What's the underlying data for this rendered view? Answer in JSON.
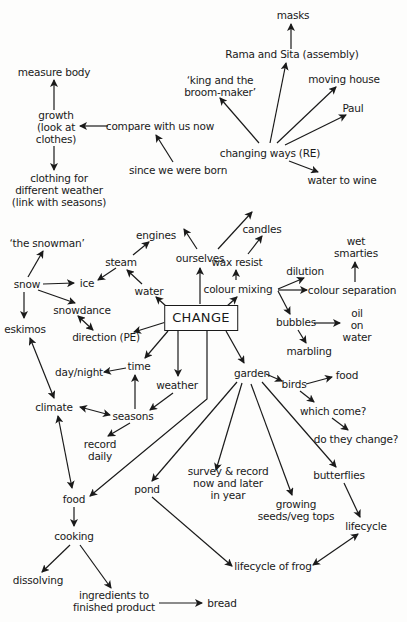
{
  "diagram": {
    "type": "concept-map",
    "root": "change",
    "colors": {
      "ink": "#1a1a1a",
      "background": "#fdfdfc"
    },
    "nodes": [
      {
        "id": "change",
        "label": "CHANGE",
        "x": 201,
        "y": 318,
        "root": true
      },
      {
        "id": "ourselves",
        "label": "ourselves",
        "x": 200,
        "y": 258
      },
      {
        "id": "since_born",
        "label": "since we were born",
        "x": 178,
        "y": 170
      },
      {
        "id": "compare",
        "label": "compare with us now",
        "x": 160,
        "y": 126
      },
      {
        "id": "growth",
        "label": "growth\n(look at\nclothes)",
        "x": 56,
        "y": 127
      },
      {
        "id": "measure",
        "label": "measure body",
        "x": 54,
        "y": 72
      },
      {
        "id": "clothing",
        "label": "clothing for\ndifferent weather\n(link with seasons)",
        "x": 59,
        "y": 190
      },
      {
        "id": "changing_ways",
        "label": "changing ways (RE)",
        "x": 270,
        "y": 153
      },
      {
        "id": "rama",
        "label": "Rama and Sita (assembly)",
        "x": 292,
        "y": 54
      },
      {
        "id": "masks",
        "label": "masks",
        "x": 293,
        "y": 15
      },
      {
        "id": "king",
        "label": "‘king and the\nbroom-maker’",
        "x": 220,
        "y": 86
      },
      {
        "id": "moving",
        "label": "moving house",
        "x": 344,
        "y": 79
      },
      {
        "id": "paul",
        "label": "Paul",
        "x": 353,
        "y": 108
      },
      {
        "id": "wine",
        "label": "water to wine",
        "x": 342,
        "y": 180
      },
      {
        "id": "wax",
        "label": "wax resist",
        "x": 237,
        "y": 262
      },
      {
        "id": "candles",
        "label": "candles",
        "x": 262,
        "y": 229
      },
      {
        "id": "colour_mixing",
        "label": "colour mixing",
        "x": 238,
        "y": 289
      },
      {
        "id": "dilution",
        "label": "dilution",
        "x": 305,
        "y": 271
      },
      {
        "id": "colour_sep",
        "label": "colour separation",
        "x": 352,
        "y": 290
      },
      {
        "id": "smarties",
        "label": "wet\nsmarties",
        "x": 356,
        "y": 247
      },
      {
        "id": "bubbles",
        "label": "bubbles",
        "x": 296,
        "y": 322
      },
      {
        "id": "oil",
        "label": "oil\non\nwater",
        "x": 357,
        "y": 325
      },
      {
        "id": "marbling",
        "label": "marbling",
        "x": 309,
        "y": 351
      },
      {
        "id": "water",
        "label": "water",
        "x": 149,
        "y": 291
      },
      {
        "id": "steam",
        "label": "steam",
        "x": 121,
        "y": 262
      },
      {
        "id": "engines",
        "label": "engines",
        "x": 156,
        "y": 235
      },
      {
        "id": "ice",
        "label": "ice",
        "x": 87,
        "y": 283
      },
      {
        "id": "snow",
        "label": "snow",
        "x": 27,
        "y": 284
      },
      {
        "id": "snowman",
        "label": "‘the snowman’",
        "x": 47,
        "y": 243
      },
      {
        "id": "snowdance",
        "label": "snowdance",
        "x": 82,
        "y": 310
      },
      {
        "id": "direction",
        "label": "direction (PE)",
        "x": 106,
        "y": 337
      },
      {
        "id": "eskimos",
        "label": "eskimos",
        "x": 25,
        "y": 329
      },
      {
        "id": "time",
        "label": "time",
        "x": 139,
        "y": 366
      },
      {
        "id": "day_night",
        "label": "day/night",
        "x": 79,
        "y": 372
      },
      {
        "id": "weather",
        "label": "weather",
        "x": 177,
        "y": 385
      },
      {
        "id": "seasons",
        "label": "seasons",
        "x": 133,
        "y": 416
      },
      {
        "id": "climate",
        "label": "climate",
        "x": 54,
        "y": 407
      },
      {
        "id": "record_daily",
        "label": "record\ndaily",
        "x": 100,
        "y": 450
      },
      {
        "id": "garden",
        "label": "garden",
        "x": 252,
        "y": 373
      },
      {
        "id": "birds",
        "label": "birds",
        "x": 294,
        "y": 384
      },
      {
        "id": "food_birds",
        "label": "food",
        "x": 347,
        "y": 375
      },
      {
        "id": "which_come",
        "label": "which come?",
        "x": 333,
        "y": 411
      },
      {
        "id": "change_q",
        "label": "do they change?",
        "x": 356,
        "y": 439
      },
      {
        "id": "butterflies",
        "label": "butterflies",
        "x": 339,
        "y": 475
      },
      {
        "id": "lifecycle",
        "label": "lifecycle",
        "x": 366,
        "y": 526
      },
      {
        "id": "survey",
        "label": "survey & record\nnow and later\nin year",
        "x": 228,
        "y": 483
      },
      {
        "id": "pond",
        "label": "pond",
        "x": 147,
        "y": 489
      },
      {
        "id": "growing",
        "label": "growing\nseeds/veg tops",
        "x": 296,
        "y": 510
      },
      {
        "id": "frog",
        "label": "lifecycle of frog",
        "x": 273,
        "y": 566
      },
      {
        "id": "food",
        "label": "food",
        "x": 74,
        "y": 499
      },
      {
        "id": "cooking",
        "label": "cooking",
        "x": 74,
        "y": 536
      },
      {
        "id": "dissolving",
        "label": "dissolving",
        "x": 38,
        "y": 580
      },
      {
        "id": "ingredients",
        "label": "ingredients to\nfinished product",
        "x": 114,
        "y": 601
      },
      {
        "id": "bread",
        "label": "bread",
        "x": 222,
        "y": 603
      }
    ],
    "edges": [
      {
        "from": "change",
        "to": "ourselves",
        "pts": [
          [
            200,
            304
          ],
          [
            200,
            268
          ]
        ]
      },
      {
        "from": "ourselves",
        "to": "since_born",
        "pts": [
          [
            197,
            249
          ],
          [
            184,
            229
          ]
        ]
      },
      {
        "from": "ourselves",
        "to": "changing_ways",
        "pts": [
          [
            218,
            249
          ],
          [
            252,
            212
          ]
        ]
      },
      {
        "from": "since_born",
        "to": "compare",
        "pts": [
          [
            173,
            162
          ],
          [
            156,
            135
          ]
        ]
      },
      {
        "from": "compare",
        "to": "growth",
        "pts": [
          [
            108,
            126
          ],
          [
            80,
            126
          ]
        ]
      },
      {
        "from": "growth",
        "to": "measure",
        "pts": [
          [
            54,
            110
          ],
          [
            54,
            80
          ]
        ]
      },
      {
        "from": "growth",
        "to": "clothing",
        "pts": [
          [
            54,
            146
          ],
          [
            54,
            170
          ]
        ]
      },
      {
        "from": "changing_ways",
        "to": "rama",
        "pts": [
          [
            270,
            143
          ],
          [
            286,
            63
          ]
        ]
      },
      {
        "from": "rama",
        "to": "masks",
        "pts": [
          [
            291,
            49
          ],
          [
            291,
            24
          ]
        ]
      },
      {
        "from": "changing_ways",
        "to": "king",
        "pts": [
          [
            259,
            143
          ],
          [
            220,
            98
          ]
        ]
      },
      {
        "from": "changing_ways",
        "to": "moving",
        "pts": [
          [
            277,
            143
          ],
          [
            336,
            87
          ]
        ]
      },
      {
        "from": "changing_ways",
        "to": "paul",
        "pts": [
          [
            285,
            145
          ],
          [
            346,
            115
          ]
        ]
      },
      {
        "from": "changing_ways",
        "to": "wine",
        "pts": [
          [
            289,
            161
          ],
          [
            318,
            172
          ]
        ]
      },
      {
        "from": "change",
        "to": "colour_mixing",
        "pts": [
          [
            226,
            307
          ],
          [
            237,
            297
          ]
        ]
      },
      {
        "from": "colour_mixing",
        "to": "wax",
        "pts": [
          [
            236,
            280
          ],
          [
            236,
            270
          ]
        ]
      },
      {
        "from": "wax",
        "to": "candles",
        "pts": [
          [
            248,
            254
          ],
          [
            262,
            236
          ]
        ]
      },
      {
        "from": "colour_mixing",
        "to": "dilution",
        "pts": [
          [
            278,
            289
          ],
          [
            304,
            278
          ]
        ]
      },
      {
        "from": "colour_mixing",
        "to": "colour_sep",
        "pts": [
          [
            278,
            290
          ],
          [
            307,
            290
          ]
        ]
      },
      {
        "from": "colour_mixing",
        "to": "bubbles",
        "pts": [
          [
            278,
            291
          ],
          [
            290,
            314
          ]
        ]
      },
      {
        "from": "colour_sep",
        "to": "smarties",
        "pts": [
          [
            355,
            282
          ],
          [
            355,
            262
          ]
        ]
      },
      {
        "from": "bubbles",
        "to": "oil",
        "pts": [
          [
            314,
            323
          ],
          [
            340,
            323
          ]
        ]
      },
      {
        "from": "bubbles",
        "to": "marbling",
        "pts": [
          [
            298,
            330
          ],
          [
            306,
            343
          ]
        ]
      },
      {
        "from": "change",
        "to": "water",
        "pts": [
          [
            167,
            307
          ],
          [
            156,
            297
          ]
        ]
      },
      {
        "from": "water",
        "to": "steam",
        "pts": [
          [
            142,
            284
          ],
          [
            127,
            270
          ]
        ]
      },
      {
        "from": "steam",
        "to": "engines",
        "pts": [
          [
            133,
            255
          ],
          [
            149,
            242
          ]
        ]
      },
      {
        "from": "steam",
        "to": "ice",
        "pts": [
          [
            116,
            268
          ],
          [
            98,
            280
          ]
        ]
      },
      {
        "from": "snow",
        "to": "snowman",
        "pts": [
          [
            28,
            277
          ],
          [
            43,
            251
          ]
        ]
      },
      {
        "from": "snow",
        "to": "ice",
        "pts": [
          [
            43,
            284
          ],
          [
            74,
            283
          ]
        ]
      },
      {
        "from": "snow",
        "to": "snowdance",
        "pts": [
          [
            38,
            290
          ],
          [
            75,
            303
          ]
        ]
      },
      {
        "from": "snow",
        "to": "eskimos",
        "pts": [
          [
            24,
            292
          ],
          [
            24,
            318
          ]
        ]
      },
      {
        "from": "snowdance",
        "to": "direction",
        "pts": [
          [
            78,
            316
          ],
          [
            93,
            330
          ]
        ],
        "bidirectional": true
      },
      {
        "from": "change",
        "to": "direction",
        "pts": [
          [
            166,
            322
          ],
          [
            134,
            332
          ]
        ]
      },
      {
        "from": "change",
        "to": "time",
        "pts": [
          [
            168,
            331
          ],
          [
            145,
            358
          ]
        ]
      },
      {
        "from": "change",
        "to": "weather",
        "pts": [
          [
            178,
            331
          ],
          [
            178,
            376
          ]
        ]
      },
      {
        "from": "time",
        "to": "day_night",
        "pts": [
          [
            126,
            368
          ],
          [
            104,
            372
          ]
        ]
      },
      {
        "from": "seasons",
        "to": "time",
        "pts": [
          [
            135,
            409
          ],
          [
            135,
            375
          ]
        ]
      },
      {
        "from": "weather",
        "to": "seasons",
        "pts": [
          [
            173,
            393
          ],
          [
            150,
            410
          ]
        ]
      },
      {
        "from": "climate",
        "to": "seasons",
        "pts": [
          [
            80,
            407
          ],
          [
            110,
            415
          ]
        ],
        "bidirectional": true
      },
      {
        "from": "seasons",
        "to": "record_daily",
        "pts": [
          [
            130,
            423
          ],
          [
            108,
            436
          ]
        ]
      },
      {
        "from": "eskimos",
        "to": "climate",
        "pts": [
          [
            30,
            338
          ],
          [
            54,
            398
          ]
        ],
        "bidirectional": true
      },
      {
        "from": "climate",
        "to": "food",
        "pts": [
          [
            58,
            416
          ],
          [
            72,
            488
          ]
        ],
        "bidirectional": true
      },
      {
        "from": "change",
        "to": "food",
        "pts": [
          [
            207,
            331
          ],
          [
            207,
            399
          ],
          [
            90,
            496
          ]
        ]
      },
      {
        "from": "change",
        "to": "garden",
        "pts": [
          [
            226,
            331
          ],
          [
            244,
            363
          ]
        ]
      },
      {
        "from": "garden",
        "to": "birds",
        "pts": [
          [
            266,
            374
          ],
          [
            282,
            381
          ]
        ]
      },
      {
        "from": "birds",
        "to": "food_birds",
        "pts": [
          [
            306,
            384
          ],
          [
            332,
            377
          ]
        ]
      },
      {
        "from": "birds",
        "to": "which_come",
        "pts": [
          [
            300,
            391
          ],
          [
            314,
            402
          ]
        ]
      },
      {
        "from": "which_come",
        "to": "change_q",
        "pts": [
          [
            332,
            418
          ],
          [
            348,
            430
          ]
        ]
      },
      {
        "from": "garden",
        "to": "butterflies",
        "pts": [
          [
            262,
            382
          ],
          [
            336,
            467
          ]
        ]
      },
      {
        "from": "butterflies",
        "to": "lifecycle",
        "pts": [
          [
            344,
            483
          ],
          [
            360,
            517
          ]
        ]
      },
      {
        "from": "lifecycle",
        "to": "frog",
        "pts": [
          [
            358,
            534
          ],
          [
            313,
            565
          ]
        ],
        "bidirectional": true
      },
      {
        "from": "garden",
        "to": "survey",
        "pts": [
          [
            242,
            383
          ],
          [
            216,
            470
          ]
        ]
      },
      {
        "from": "garden",
        "to": "pond",
        "pts": [
          [
            237,
            382
          ],
          [
            152,
            481
          ]
        ]
      },
      {
        "from": "garden",
        "to": "growing",
        "pts": [
          [
            251,
            384
          ],
          [
            292,
            495
          ]
        ]
      },
      {
        "from": "pond",
        "to": "frog",
        "pts": [
          [
            152,
            497
          ],
          [
            232,
            566
          ]
        ]
      },
      {
        "from": "food",
        "to": "cooking",
        "pts": [
          [
            74,
            507
          ],
          [
            74,
            526
          ]
        ]
      },
      {
        "from": "cooking",
        "to": "dissolving",
        "pts": [
          [
            70,
            545
          ],
          [
            42,
            572
          ]
        ]
      },
      {
        "from": "cooking",
        "to": "ingredients",
        "pts": [
          [
            80,
            545
          ],
          [
            111,
            588
          ]
        ]
      },
      {
        "from": "ingredients",
        "to": "bread",
        "pts": [
          [
            159,
            603
          ],
          [
            202,
            603
          ]
        ]
      }
    ]
  }
}
